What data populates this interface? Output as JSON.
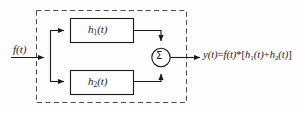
{
  "diagram": {
    "type": "block-diagram",
    "background_color": "#fdfdfd",
    "line_color": "#1a1a1a",
    "dashed_border_color": "#4a4a4a",
    "input": {
      "label": "f(t)",
      "italic": true
    },
    "blocks": [
      {
        "name": "block-h1",
        "label_base": "h",
        "label_sub": "1",
        "label_tail": "(t)",
        "label_plain": "h1(t)"
      },
      {
        "name": "block-h2",
        "label_base": "h",
        "label_sub": "2",
        "label_tail": "(t)",
        "label_plain": "h2(t)"
      }
    ],
    "summation": {
      "symbol": "Σ",
      "name": "summing-junction"
    },
    "output": {
      "lhs": "y(t)",
      "equals": "=",
      "rhs_prefix": "f(t)",
      "convolution_operator": "*",
      "bracket_open": "[",
      "term1_base": "h",
      "term1_sub": "1",
      "term1_tail": "(t)",
      "plus": "+",
      "term2_base": "h",
      "term2_sub": "2",
      "term2_tail": "(t)",
      "bracket_close": "]",
      "label_plain": "y(t)=f(t)*[h1(t)+h2(t)]"
    }
  }
}
